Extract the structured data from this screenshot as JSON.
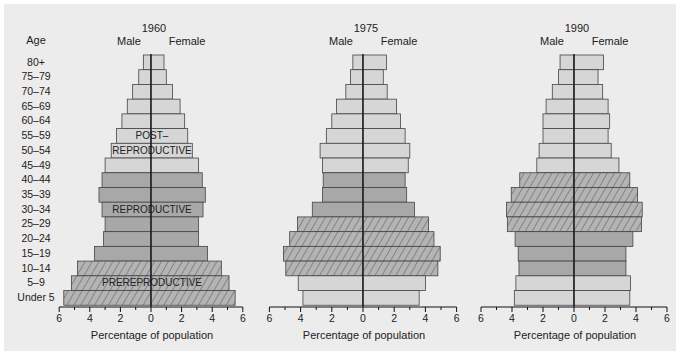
{
  "chart_data": {
    "type": "bar",
    "subtype": "population-pyramid",
    "ylabel": "Age",
    "xlabel": "Percentage of population",
    "xticks": [
      6,
      4,
      2,
      0,
      2,
      4,
      6
    ],
    "xlim": [
      -6,
      6
    ],
    "categories": [
      "80+",
      "75–79",
      "70–74",
      "65–69",
      "60–64",
      "55–59",
      "50–54",
      "45–49",
      "40–44",
      "35–39",
      "30–34",
      "25–29",
      "20–24",
      "15–19",
      "10–14",
      "5–9",
      "Under 5"
    ],
    "sex_labels": {
      "left": "Male",
      "right": "Female"
    },
    "legend": {
      "light": "Post-reproductive",
      "medium": "Reproductive",
      "hatched": "Prereproductive (1960 cohort)"
    },
    "panels": [
      {
        "year": "1960",
        "annotations": [
          {
            "text": "POST–",
            "row": 5
          },
          {
            "text": "REPRODUCTIVE",
            "row": 6
          },
          {
            "text": "REPRODUCTIVE",
            "row": 10
          },
          {
            "text": "PREREPRODUCTIVE",
            "row": 15
          }
        ],
        "male": [
          0.5,
          0.8,
          1.2,
          1.55,
          1.9,
          2.25,
          2.6,
          3.0,
          3.2,
          3.4,
          3.2,
          3.0,
          3.1,
          3.7,
          4.8,
          5.2,
          5.7
        ],
        "female": [
          0.85,
          1.0,
          1.4,
          1.9,
          2.2,
          2.4,
          2.7,
          3.1,
          3.35,
          3.55,
          3.4,
          3.1,
          3.1,
          3.7,
          4.6,
          5.1,
          5.5
        ],
        "styles": [
          "light",
          "light",
          "light",
          "light",
          "light",
          "light",
          "light",
          "light",
          "medium",
          "medium",
          "medium",
          "medium",
          "medium",
          "medium",
          "hatched",
          "hatched",
          "hatched"
        ]
      },
      {
        "year": "1975",
        "annotations": [],
        "male": [
          0.65,
          0.8,
          1.1,
          1.7,
          2.0,
          2.35,
          2.75,
          2.6,
          2.55,
          2.6,
          3.25,
          4.2,
          4.7,
          5.1,
          4.95,
          4.15,
          3.85
        ],
        "female": [
          1.5,
          1.3,
          1.55,
          2.15,
          2.4,
          2.7,
          3.0,
          2.9,
          2.7,
          2.8,
          3.3,
          4.2,
          4.55,
          4.95,
          4.8,
          4.0,
          3.6
        ],
        "styles": [
          "light",
          "light",
          "light",
          "light",
          "light",
          "light",
          "light",
          "light",
          "medium",
          "medium",
          "medium",
          "hatched",
          "hatched",
          "hatched",
          "hatched",
          "light",
          "light"
        ]
      },
      {
        "year": "1990",
        "annotations": [],
        "male": [
          0.9,
          1.0,
          1.4,
          1.8,
          2.0,
          2.0,
          2.25,
          2.4,
          3.5,
          4.05,
          4.35,
          4.3,
          3.8,
          3.6,
          3.55,
          3.75,
          3.85
        ],
        "female": [
          1.9,
          1.55,
          1.85,
          2.2,
          2.3,
          2.2,
          2.4,
          2.9,
          3.6,
          4.1,
          4.4,
          4.35,
          3.8,
          3.35,
          3.35,
          3.65,
          3.6
        ],
        "styles": [
          "light",
          "light",
          "light",
          "light",
          "light",
          "light",
          "light",
          "light",
          "hatched",
          "hatched",
          "hatched",
          "hatched",
          "medium",
          "medium",
          "medium",
          "light",
          "light"
        ]
      }
    ]
  },
  "labels": {
    "age_header": "Age",
    "axis_title": "Percentage of population",
    "male": "Male",
    "female": "Female"
  },
  "colors": {
    "background": "#ececec",
    "light": "#d6d6d6",
    "medium": "#a8a8a8",
    "hatched_base": "#b4b4b4",
    "hatch_line": "#555555",
    "stroke": "#444444",
    "axis": "#111111"
  }
}
